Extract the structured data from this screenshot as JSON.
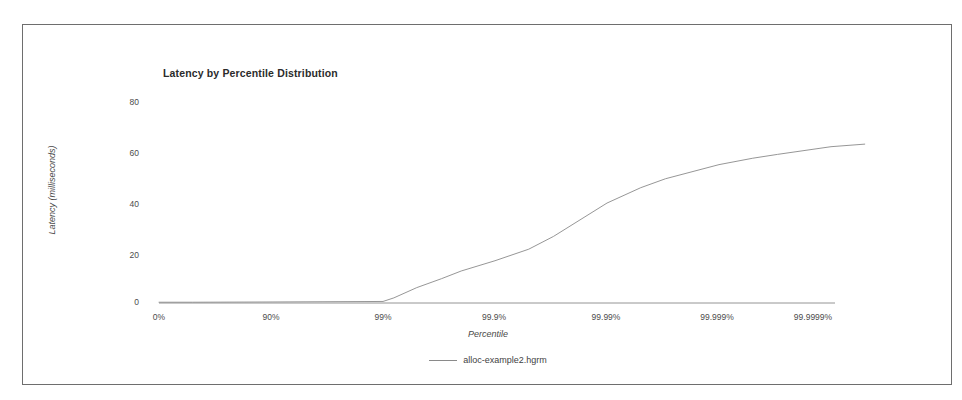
{
  "chart_data": {
    "type": "line",
    "title": "Latency by Percentile Distribution",
    "xlabel": "Percentile",
    "ylabel": "Latency (milliseconds)",
    "ylim": [
      0,
      80
    ],
    "yticks": [
      0,
      20,
      40,
      60,
      80
    ],
    "ytick_labels": [
      "0",
      "20",
      "40",
      "60",
      "80"
    ],
    "xtick_labels": [
      "0%",
      "90%",
      "99%",
      "99.9%",
      "99.99%",
      "99.999%",
      "99.9999%"
    ],
    "x_axis_kind": "percentile-logarithmic",
    "grid": false,
    "legend_position": "bottom-center",
    "series": [
      {
        "name": "alloc-example2.hgrm",
        "color": "#8a8a8a",
        "x_percentile_labels": [
          "0%",
          "50%",
          "90%",
          "99%",
          "99.2%",
          "99.5%",
          "99.7%",
          "99.8%",
          "99.9%",
          "99.95%",
          "99.97%",
          "99.99%",
          "99.995%",
          "99.997%",
          "99.999%",
          "99.9995%",
          "99.9997%",
          "99.9999%",
          "99.99995%"
        ],
        "values": [
          0.3,
          0.3,
          0.4,
          0.6,
          2.0,
          6.0,
          9.5,
          12.5,
          16.5,
          21.0,
          26.0,
          39.0,
          45.0,
          48.5,
          54.0,
          56.5,
          58.0,
          61.0,
          62.0
        ],
        "units": "milliseconds"
      }
    ]
  },
  "legend": {
    "entries": [
      {
        "label": "alloc-example2.hgrm"
      }
    ]
  },
  "colors": {
    "series_line": "#8a8a8a",
    "axis": "#6b6b6b",
    "frame": "#6e6e6e",
    "text": "#3a3a3a"
  }
}
